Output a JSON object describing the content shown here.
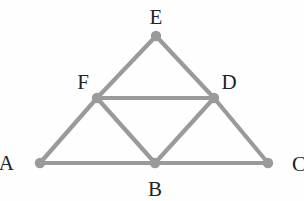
{
  "figure": {
    "kind": "geometry-diagram",
    "canvas": {
      "width": 304,
      "height": 201
    },
    "style": {
      "background_color": "#fefefe",
      "stroke_color": "#9a9a9a",
      "vertex_dot_color": "#9a9a9a",
      "label_color": "#232323",
      "stroke_width": 4.2,
      "vertex_dot_radius": 5.2,
      "label_font_size": 21
    },
    "vertices": [
      {
        "id": "A",
        "label": "A",
        "x": 40,
        "y": 163,
        "label_x": 14,
        "label_y": 163,
        "label_anchor": "end"
      },
      {
        "id": "B",
        "label": "B",
        "x": 155,
        "y": 163,
        "label_x": 155,
        "label_y": 189,
        "label_anchor": "middle"
      },
      {
        "id": "C",
        "label": "C",
        "x": 268,
        "y": 163,
        "label_x": 292,
        "label_y": 164,
        "label_anchor": "start"
      },
      {
        "id": "D",
        "label": "D",
        "x": 214,
        "y": 98,
        "label_x": 229,
        "label_y": 82,
        "label_anchor": "middle"
      },
      {
        "id": "E",
        "label": "E",
        "x": 156,
        "y": 36,
        "label_x": 156,
        "label_y": 17,
        "label_anchor": "middle"
      },
      {
        "id": "F",
        "label": "F",
        "x": 97,
        "y": 98,
        "label_x": 83,
        "label_y": 82,
        "label_anchor": "middle"
      }
    ],
    "edges": [
      {
        "id": "A-C",
        "from": "A",
        "to": "C",
        "role": "outer-base"
      },
      {
        "id": "A-F",
        "from": "A",
        "to": "F",
        "role": "outer-side"
      },
      {
        "id": "F-E",
        "from": "F",
        "to": "E",
        "role": "outer-side"
      },
      {
        "id": "E-D",
        "from": "E",
        "to": "D",
        "role": "outer-side"
      },
      {
        "id": "D-C",
        "from": "D",
        "to": "C",
        "role": "outer-side"
      },
      {
        "id": "F-D",
        "from": "F",
        "to": "D",
        "role": "medial"
      },
      {
        "id": "F-B",
        "from": "F",
        "to": "B",
        "role": "medial"
      },
      {
        "id": "B-D",
        "from": "B",
        "to": "D",
        "role": "medial"
      }
    ]
  }
}
